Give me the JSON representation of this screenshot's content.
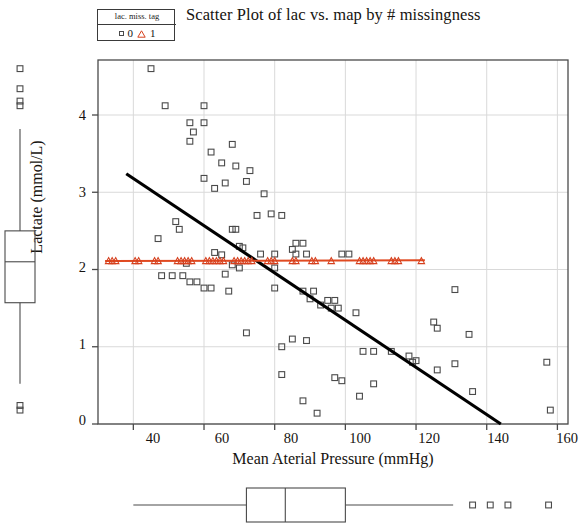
{
  "chart_data": {
    "type": "scatter",
    "title": "Scatter Plot of lac vs. map by # missingness",
    "xlabel": "Mean Aterial Pressure (mmHg)",
    "ylabel": "Lactate (mmol/L)",
    "xlim": [
      30,
      163
    ],
    "ylim": [
      -0.12,
      4.75
    ],
    "xticks": [
      40,
      60,
      80,
      100,
      120,
      140,
      160
    ],
    "yticks": [
      0,
      1,
      2,
      3,
      4
    ],
    "grid": true,
    "legend": {
      "title": "lac. miss. tag",
      "position": "top-left-outside",
      "entries": [
        {
          "label": "0",
          "marker": "square",
          "color": "#4a4a4a"
        },
        {
          "label": "1",
          "marker": "triangle",
          "color": "#d6401e"
        }
      ]
    },
    "colors": {
      "group0_marker": "#4a4a4a",
      "group0_fit": "#000000",
      "group1_marker": "#d6401e",
      "group1_fit": "#e04a21",
      "grid": "#d9d9d9",
      "axis": "#4a4a4a"
    },
    "series": [
      {
        "name": "0",
        "marker": "square",
        "color": "#4a4a4a",
        "points": [
          [
            45.0,
            4.6
          ],
          [
            49.0,
            4.12
          ],
          [
            60.0,
            4.12
          ],
          [
            56.0,
            3.9
          ],
          [
            60.0,
            3.9
          ],
          [
            57.0,
            3.78
          ],
          [
            56.0,
            3.66
          ],
          [
            68.0,
            3.62
          ],
          [
            62.0,
            3.52
          ],
          [
            65.0,
            3.38
          ],
          [
            69.0,
            3.34
          ],
          [
            73.0,
            3.28
          ],
          [
            60.0,
            3.18
          ],
          [
            72.0,
            3.14
          ],
          [
            66.0,
            3.12
          ],
          [
            63.0,
            3.05
          ],
          [
            77.0,
            2.98
          ],
          [
            79.0,
            2.72
          ],
          [
            75.0,
            2.7
          ],
          [
            82.0,
            2.7
          ],
          [
            52.0,
            2.62
          ],
          [
            53.0,
            2.52
          ],
          [
            68.0,
            2.52
          ],
          [
            69.0,
            2.52
          ],
          [
            47.0,
            2.4
          ],
          [
            86.0,
            2.34
          ],
          [
            88.0,
            2.34
          ],
          [
            71.0,
            2.28
          ],
          [
            85.0,
            2.26
          ],
          [
            63.0,
            2.22
          ],
          [
            65.0,
            2.19
          ],
          [
            70.0,
            2.3
          ],
          [
            76.0,
            2.2
          ],
          [
            80.0,
            2.2
          ],
          [
            86.0,
            2.2
          ],
          [
            89.0,
            2.2
          ],
          [
            99.0,
            2.2
          ],
          [
            101.0,
            2.2
          ],
          [
            55.0,
            2.08
          ],
          [
            68.0,
            2.06
          ],
          [
            70.0,
            2.02
          ],
          [
            80.0,
            2.02
          ],
          [
            66.0,
            1.94
          ],
          [
            48.0,
            1.92
          ],
          [
            51.0,
            1.92
          ],
          [
            54.0,
            1.92
          ],
          [
            56.0,
            1.84
          ],
          [
            58.0,
            1.84
          ],
          [
            60.0,
            1.76
          ],
          [
            62.0,
            1.76
          ],
          [
            67.0,
            1.72
          ],
          [
            80.0,
            1.76
          ],
          [
            88.0,
            1.72
          ],
          [
            91.0,
            1.72
          ],
          [
            90.0,
            1.62
          ],
          [
            95.0,
            1.6
          ],
          [
            97.0,
            1.6
          ],
          [
            93.0,
            1.54
          ],
          [
            96.0,
            1.5
          ],
          [
            98.0,
            1.5
          ],
          [
            103.0,
            1.44
          ],
          [
            131.0,
            1.74
          ],
          [
            125.0,
            1.32
          ],
          [
            126.0,
            1.24
          ],
          [
            72.0,
            1.18
          ],
          [
            85.0,
            1.1
          ],
          [
            89.0,
            1.08
          ],
          [
            135.0,
            1.16
          ],
          [
            82.0,
            1.0
          ],
          [
            105.0,
            0.94
          ],
          [
            108.0,
            0.94
          ],
          [
            113.0,
            0.94
          ],
          [
            118.0,
            0.88
          ],
          [
            120.0,
            0.82
          ],
          [
            119.0,
            0.8
          ],
          [
            131.0,
            0.78
          ],
          [
            157.0,
            0.8
          ],
          [
            126.0,
            0.7
          ],
          [
            82.0,
            0.64
          ],
          [
            97.0,
            0.6
          ],
          [
            99.0,
            0.56
          ],
          [
            108.0,
            0.52
          ],
          [
            136.0,
            0.42
          ],
          [
            104.0,
            0.36
          ],
          [
            88.0,
            0.3
          ],
          [
            92.0,
            0.14
          ],
          [
            158.0,
            0.18
          ]
        ]
      },
      {
        "name": "1",
        "marker": "triangle",
        "color": "#d6401e",
        "constant_y": 2.11,
        "x_values": [
          33.0,
          34.0,
          35.0,
          40.5,
          41.5,
          46.0,
          47.0,
          52.5,
          53.5,
          54.5,
          55.5,
          56.5,
          60.5,
          61.5,
          62.5,
          63.5,
          64.5,
          65.5,
          68.5,
          69.5,
          70.5,
          71.5,
          72.5,
          73.5,
          78.0,
          79.0,
          80.0,
          85.0,
          86.0,
          90.5,
          91.5,
          96.0,
          104.0,
          105.0,
          106.0,
          107.0,
          108.0,
          113.0,
          114.0,
          115.0,
          121.5
        ]
      }
    ],
    "fit_lines": [
      {
        "name": "group0-fit",
        "color": "#000000",
        "width": 3.1,
        "x1": 38.0,
        "y1": 3.24,
        "x2": 144.0,
        "y2": 0.0
      },
      {
        "name": "group1-fit",
        "color": "#e04a21",
        "width": 2.0,
        "x1": 32.0,
        "y1": 2.11,
        "x2": 122.5,
        "y2": 2.12
      }
    ],
    "marginal_boxplots": {
      "y_axis_box": {
        "orientation": "vertical",
        "whisker_low": 0.52,
        "q1": 1.57,
        "median": 2.1,
        "q3": 2.5,
        "whisker_high": 3.82,
        "outliers_high": [
          4.12,
          4.18,
          4.34,
          4.6
        ],
        "outliers_low": [
          0.18,
          0.24
        ]
      },
      "x_axis_box": {
        "orientation": "horizontal",
        "whisker_low": 40.0,
        "q1": 72.0,
        "median": 83.0,
        "q3": 100.0,
        "whisker_high": 130.5,
        "outliers_high": [
          136.0,
          141.0,
          146.0,
          157.5
        ]
      }
    }
  },
  "title": "Scatter Plot of lac vs. map by # missingness",
  "axes": {
    "ylabel": "Lactate (mmol/L)",
    "xlabel": "Mean Aterial Pressure (mmHg)",
    "xticks": [
      "40",
      "60",
      "80",
      "100",
      "120",
      "140",
      "160"
    ],
    "yticks": [
      "4",
      "3",
      "2",
      "1",
      "0"
    ]
  },
  "legend": {
    "title": "lac. miss. tag",
    "item0": "0",
    "item1": "1"
  }
}
